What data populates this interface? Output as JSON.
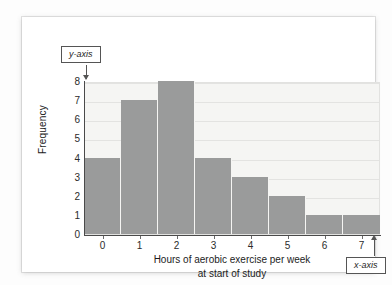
{
  "figure": {
    "card_background": "#ffffff",
    "page_background": "#fdfdfd"
  },
  "annotations": {
    "y_axis_callout": "y-axis",
    "x_axis_callout": "x-axis"
  },
  "chart_data": {
    "type": "bar",
    "title": "",
    "xlabel_line1": "Hours of aerobic exercise per week",
    "xlabel_line2": "at start of study",
    "ylabel": "Frequency",
    "categories": [
      "0",
      "1",
      "2",
      "3",
      "4",
      "5",
      "6",
      "7"
    ],
    "values": [
      4,
      7,
      8,
      4,
      3,
      2,
      1,
      1
    ],
    "ylim": [
      0,
      8
    ],
    "yticks": [
      "8",
      "7",
      "6",
      "5",
      "4",
      "3",
      "2",
      "1",
      "0"
    ],
    "xticks": [
      "0",
      "1",
      "2",
      "3",
      "4",
      "5",
      "6",
      "7"
    ],
    "grid": true,
    "legend": "none",
    "bar_color": "#9a9b9b",
    "plot_background": "#f5f5f3",
    "gridline_color": "#e3e3e1",
    "axis_color": "#4a4a4a"
  }
}
